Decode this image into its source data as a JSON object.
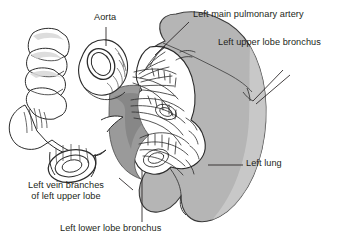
{
  "figure": {
    "background_color": "#ffffff",
    "text_color": "#231f20",
    "lung_fill_color": "#b5b5b5",
    "lung_shadow_color": "#8c8c8c",
    "line_color": "#231f20"
  },
  "labels": {
    "aorta": "Aorta",
    "pulmonary_artery": "Left main pulmonary artery",
    "upper_lobe_bronchus": "Left upper lobe bronchus",
    "left_lung": "Left lung",
    "vein_branches_line1": "Left vein branches",
    "vein_branches_line2": "of left upper lobe",
    "lower_lobe_bronchus": "Left lower lobe bronchus"
  },
  "structures": [
    {
      "name": "aorta",
      "description": "cut aortic arch with elliptical lumen and hatched wall"
    },
    {
      "name": "trachea-main-bronchus",
      "description": "segmented airway with cartilage rings"
    },
    {
      "name": "bronchus-cut-end",
      "description": "cut bronchial stump with concentric rings"
    },
    {
      "name": "left-lung",
      "description": "gray lung silhouette with hilar window and lingular notch"
    },
    {
      "name": "hilar-vessels",
      "description": "branching pulmonary vessels and bronchi at the hilum"
    },
    {
      "name": "mediastinal-surface",
      "description": "dark gray wedge behind hilar vessels"
    }
  ]
}
